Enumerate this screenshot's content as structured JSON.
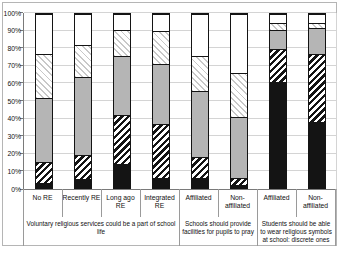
{
  "colors": {
    "segment_black": "#141414",
    "segment_gray": "#b5b5b5",
    "hatch_dark_stripe": "#141414",
    "hatch_light_stripe": "#c8c8c8",
    "axis_line": "#7a7a7a",
    "gridline": "#d4d4d4",
    "divider_line": "#9a9a9a",
    "chart_border": "#b5b5b5",
    "background": "#ffffff"
  },
  "chart_data": {
    "type": "bar",
    "subtype": "stacked-100-percent-column",
    "title": "",
    "legend": false,
    "grid": true,
    "y_axis": {
      "min": 0,
      "max": 100,
      "step": 10,
      "ticks": [
        "0%",
        "10%",
        "20%",
        "30%",
        "40%",
        "50%",
        "60%",
        "70%",
        "80%",
        "90%",
        "100%"
      ]
    },
    "categories": [
      "No RE",
      "Recently RE",
      "Long ago\nRE",
      "Integrated\nRE",
      "Affiliated",
      "Non-\naffiliated",
      "Affiliated",
      "Non-\naffiliated"
    ],
    "groups": [
      {
        "label": "Voluntary religious services could be a part of school\nlife",
        "span": 4
      },
      {
        "label": "Schools should provide\nfacilities for pupils to pray",
        "span": 2
      },
      {
        "label": "Students should be able\nto wear religious symbols\nat school: discrete ones",
        "span": 2
      }
    ],
    "series": [
      {
        "name": "solid-black",
        "pattern": "p-black",
        "values": [
          3,
          5,
          14,
          6,
          6,
          2,
          61,
          38
        ]
      },
      {
        "name": "black-diagonal-hatch",
        "pattern": "p-darkhatch",
        "values": [
          12,
          14,
          28,
          31,
          12,
          4,
          19,
          39
        ]
      },
      {
        "name": "solid-gray",
        "pattern": "p-gray",
        "values": [
          37,
          45,
          34,
          34,
          38,
          35,
          11,
          15
        ]
      },
      {
        "name": "gray-diagonal-hatch",
        "pattern": "p-lighthatch",
        "values": [
          25,
          18,
          15,
          19,
          20,
          25,
          4,
          3
        ]
      },
      {
        "name": "white",
        "pattern": "p-white",
        "values": [
          23,
          18,
          9,
          10,
          24,
          34,
          5,
          5
        ]
      }
    ]
  }
}
